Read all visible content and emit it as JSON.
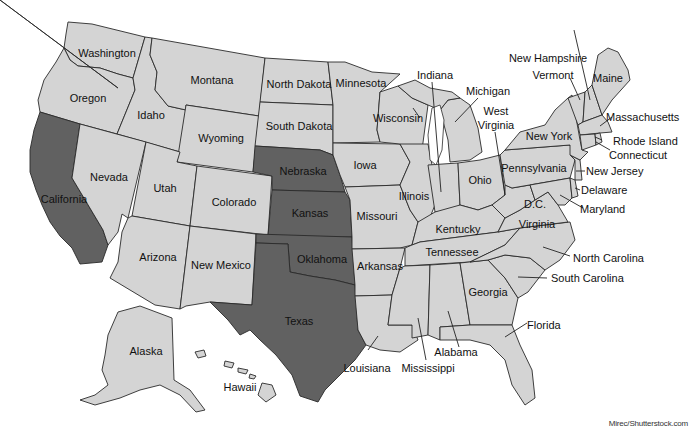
{
  "map": {
    "title": "United States map",
    "colors": {
      "default_fill": "#d4d4d4",
      "highlight_fill": "#616161",
      "border": "#2a2a2a",
      "water": "#ffffff"
    },
    "highlighted_states": [
      "California",
      "Nebraska",
      "Kansas",
      "Oklahoma",
      "Texas"
    ],
    "labels": {
      "washington": "Washington",
      "oregon": "Oregon",
      "california": "California",
      "idaho": "Idaho",
      "nevada": "Nevada",
      "montana": "Montana",
      "wyoming": "Wyoming",
      "utah": "Utah",
      "arizona": "Arizona",
      "colorado": "Colorado",
      "new_mexico": "New Mexico",
      "north_dakota": "North Dakota",
      "south_dakota": "South Dakota",
      "nebraska": "Nebraska",
      "kansas": "Kansas",
      "oklahoma": "Oklahoma",
      "texas": "Texas",
      "minnesota": "Minnesota",
      "iowa": "Iowa",
      "missouri": "Missouri",
      "arkansas": "Arkansas",
      "louisiana": "Louisiana",
      "wisconsin": "Wisconsin",
      "illinois": "Illinois",
      "indiana": "Indiana",
      "michigan": "Michigan",
      "ohio": "Ohio",
      "kentucky": "Kentucky",
      "tennessee": "Tennessee",
      "mississippi": "Mississippi",
      "alabama": "Alabama",
      "georgia": "Georgia",
      "florida": "Florida",
      "south_carolina": "South Carolina",
      "north_carolina": "North Carolina",
      "virginia": "Virginia",
      "west_virginia_1": "West",
      "west_virginia_2": "Virginia",
      "dc": "D.C.",
      "maryland": "Maryland",
      "delaware": "Delaware",
      "new_jersey": "New Jersey",
      "pennsylvania": "Pennsylvania",
      "new_york": "New York",
      "connecticut": "Connecticut",
      "rhode_island": "Rhode Island",
      "massachusetts": "Massachusetts",
      "vermont": "Vermont",
      "new_hampshire": "New Hampshire",
      "maine": "Maine",
      "alaska": "Alaska",
      "hawaii": "Hawaii"
    },
    "credit": "Mirec/Shutterstock.com"
  }
}
